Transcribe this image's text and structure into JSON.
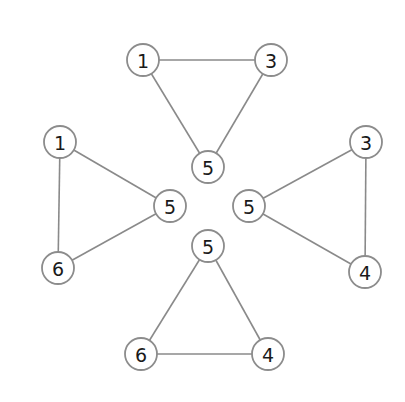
{
  "diagram": {
    "title": "",
    "node_radius": 16,
    "colors": {
      "edge": "#8a8a8a",
      "node_stroke": "#8c8c8c",
      "node_fill": "#ffffff",
      "label": "#1a1a1a"
    },
    "triangles": [
      {
        "id": "top",
        "nodes": [
          {
            "label": "1",
            "x": 143,
            "y": 60
          },
          {
            "label": "3",
            "x": 271,
            "y": 60
          },
          {
            "label": "5",
            "x": 208,
            "y": 167
          }
        ]
      },
      {
        "id": "left",
        "nodes": [
          {
            "label": "1",
            "x": 60,
            "y": 142
          },
          {
            "label": "5",
            "x": 170,
            "y": 206
          },
          {
            "label": "6",
            "x": 58,
            "y": 268
          }
        ]
      },
      {
        "id": "right",
        "nodes": [
          {
            "label": "3",
            "x": 366,
            "y": 142
          },
          {
            "label": "5",
            "x": 249,
            "y": 206
          },
          {
            "label": "4",
            "x": 365,
            "y": 272
          }
        ]
      },
      {
        "id": "bottom",
        "nodes": [
          {
            "label": "5",
            "x": 208,
            "y": 246
          },
          {
            "label": "6",
            "x": 141,
            "y": 354
          },
          {
            "label": "4",
            "x": 268,
            "y": 354
          }
        ]
      }
    ]
  }
}
